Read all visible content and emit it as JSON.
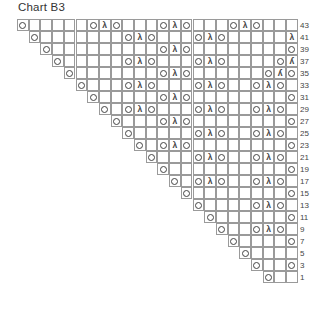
{
  "title": "Chart B3",
  "grid": {
    "columns": 24,
    "rows": 22
  },
  "symbols": {
    "O": "yarn-over",
    "λ": "centered-decrease",
    "ʎ": "right-edge-decrease"
  },
  "rows": [
    {
      "label": "43",
      "start": 1,
      "stitches": {
        "1": "O",
        "7": "O",
        "8": "λ",
        "9": "O",
        "13": "O",
        "14": "λ",
        "15": "O",
        "19": "O",
        "20": "λ",
        "21": "O"
      }
    },
    {
      "label": "41",
      "start": 2,
      "stitches": {
        "2": "O",
        "10": "O",
        "11": "λ",
        "12": "O",
        "16": "O",
        "17": "λ",
        "18": "O",
        "24": "λ"
      }
    },
    {
      "label": "39",
      "start": 3,
      "stitches": {
        "3": "O",
        "13": "O",
        "14": "λ",
        "15": "O",
        "24": "O"
      }
    },
    {
      "label": "37",
      "start": 4,
      "stitches": {
        "4": "O",
        "10": "O",
        "11": "λ",
        "12": "O",
        "16": "O",
        "17": "λ",
        "18": "O",
        "23": "O",
        "24": "ʎ"
      }
    },
    {
      "label": "35",
      "start": 5,
      "stitches": {
        "5": "O",
        "13": "O",
        "14": "λ",
        "15": "O",
        "22": "O",
        "23": "ʎ",
        "24": "O"
      }
    },
    {
      "label": "33",
      "start": 6,
      "stitches": {
        "6": "O",
        "10": "O",
        "11": "λ",
        "12": "O",
        "16": "O",
        "17": "λ",
        "18": "O",
        "21": "O",
        "22": "λ",
        "23": "O"
      }
    },
    {
      "label": "31",
      "start": 7,
      "stitches": {
        "7": "O",
        "13": "O",
        "14": "λ",
        "15": "O",
        "24": "O"
      }
    },
    {
      "label": "29",
      "start": 8,
      "stitches": {
        "8": "O",
        "10": "O",
        "11": "λ",
        "12": "O",
        "16": "O",
        "17": "λ",
        "18": "O",
        "21": "O",
        "22": "λ",
        "23": "O"
      }
    },
    {
      "label": "27",
      "start": 9,
      "stitches": {
        "9": "O",
        "13": "O",
        "14": "λ",
        "15": "O",
        "24": "O"
      }
    },
    {
      "label": "25",
      "start": 10,
      "stitches": {
        "10": "O",
        "16": "O",
        "17": "λ",
        "18": "O",
        "21": "O",
        "22": "λ",
        "23": "O"
      }
    },
    {
      "label": "23",
      "start": 11,
      "stitches": {
        "11": "O",
        "13": "O",
        "14": "λ",
        "15": "O",
        "24": "O"
      }
    },
    {
      "label": "21",
      "start": 12,
      "stitches": {
        "12": "O",
        "16": "O",
        "17": "λ",
        "18": "O",
        "21": "O",
        "22": "λ",
        "23": "O"
      }
    },
    {
      "label": "19",
      "start": 13,
      "stitches": {
        "13": "O",
        "24": "O"
      }
    },
    {
      "label": "17",
      "start": 14,
      "stitches": {
        "14": "O",
        "16": "O",
        "17": "λ",
        "18": "O",
        "21": "O",
        "22": "λ",
        "23": "O"
      }
    },
    {
      "label": "15",
      "start": 15,
      "stitches": {
        "15": "O",
        "24": "O"
      }
    },
    {
      "label": "13",
      "start": 16,
      "stitches": {
        "16": "O",
        "21": "O",
        "22": "λ",
        "23": "O"
      }
    },
    {
      "label": "11",
      "start": 17,
      "stitches": {
        "17": "O",
        "24": "O"
      }
    },
    {
      "label": "9",
      "start": 18,
      "stitches": {
        "18": "O",
        "21": "O",
        "22": "λ",
        "23": "O"
      }
    },
    {
      "label": "7",
      "start": 19,
      "stitches": {
        "19": "O",
        "24": "O"
      }
    },
    {
      "label": "5",
      "start": 20,
      "stitches": {
        "20": "O"
      }
    },
    {
      "label": "3",
      "start": 21,
      "stitches": {
        "21": "O",
        "24": "O"
      }
    },
    {
      "label": "1",
      "start": 22,
      "stitches": {
        "22": "O"
      }
    }
  ]
}
